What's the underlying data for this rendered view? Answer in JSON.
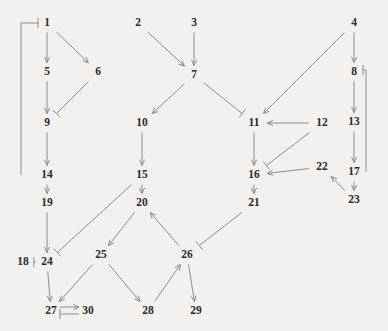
{
  "diagram": {
    "title": "",
    "type": "directed-graph",
    "canvas": {
      "width": 388,
      "height": 331
    },
    "style": {
      "background": "#f2f1ef",
      "edge_color": "#8b8b8b",
      "label_color": "#2b2b2b"
    },
    "nodes": [
      {
        "id": "1",
        "label": "1",
        "x": 47,
        "y": 23
      },
      {
        "id": "2",
        "label": "2",
        "x": 138,
        "y": 23
      },
      {
        "id": "3",
        "label": "3",
        "x": 194,
        "y": 23
      },
      {
        "id": "4",
        "label": "4",
        "x": 354,
        "y": 23
      },
      {
        "id": "5",
        "label": "5",
        "x": 47,
        "y": 72
      },
      {
        "id": "6",
        "label": "6",
        "x": 98,
        "y": 72
      },
      {
        "id": "7",
        "label": "7",
        "x": 194,
        "y": 75
      },
      {
        "id": "8",
        "label": "8",
        "x": 354,
        "y": 72
      },
      {
        "id": "9",
        "label": "9",
        "x": 47,
        "y": 123
      },
      {
        "id": "10",
        "label": "10",
        "x": 142,
        "y": 123
      },
      {
        "id": "11",
        "label": "11",
        "x": 254,
        "y": 123
      },
      {
        "id": "12",
        "label": "12",
        "x": 322,
        "y": 123
      },
      {
        "id": "13",
        "label": "13",
        "x": 354,
        "y": 122
      },
      {
        "id": "14",
        "label": "14",
        "x": 47,
        "y": 175
      },
      {
        "id": "15",
        "label": "15",
        "x": 142,
        "y": 175
      },
      {
        "id": "16",
        "label": "16",
        "x": 254,
        "y": 175
      },
      {
        "id": "17",
        "label": "17",
        "x": 354,
        "y": 172
      },
      {
        "id": "18",
        "label": "18",
        "x": 23,
        "y": 262
      },
      {
        "id": "19",
        "label": "19",
        "x": 47,
        "y": 203
      },
      {
        "id": "20",
        "label": "20",
        "x": 142,
        "y": 203
      },
      {
        "id": "21",
        "label": "21",
        "x": 254,
        "y": 203
      },
      {
        "id": "22",
        "label": "22",
        "x": 322,
        "y": 167
      },
      {
        "id": "23",
        "label": "23",
        "x": 354,
        "y": 200
      },
      {
        "id": "24",
        "label": "24",
        "x": 47,
        "y": 262
      },
      {
        "id": "25",
        "label": "25",
        "x": 101,
        "y": 255
      },
      {
        "id": "26",
        "label": "26",
        "x": 187,
        "y": 255
      },
      {
        "id": "27",
        "label": "27",
        "x": 51,
        "y": 311
      },
      {
        "id": "28",
        "label": "28",
        "x": 148,
        "y": 311
      },
      {
        "id": "29",
        "label": "29",
        "x": 196,
        "y": 311
      },
      {
        "id": "30",
        "label": "30",
        "x": 88,
        "y": 311
      }
    ],
    "edges": [
      {
        "from": "1",
        "to": "5",
        "head": "arrow"
      },
      {
        "from": "1",
        "to": "6",
        "head": "arrow"
      },
      {
        "from": "5",
        "to": "9",
        "head": "arrow"
      },
      {
        "from": "6",
        "to": "9",
        "head": "bar"
      },
      {
        "from": "9",
        "to": "14",
        "head": "arrow"
      },
      {
        "from": "14",
        "to": "1",
        "head": "bar"
      },
      {
        "from": "14",
        "to": "19",
        "head": "arrow"
      },
      {
        "from": "19",
        "to": "24",
        "head": "arrow"
      },
      {
        "from": "2",
        "to": "7",
        "head": "arrow"
      },
      {
        "from": "3",
        "to": "7",
        "head": "arrow"
      },
      {
        "from": "7",
        "to": "10",
        "head": "arrow"
      },
      {
        "from": "7",
        "to": "11",
        "head": "bar"
      },
      {
        "from": "10",
        "to": "15",
        "head": "arrow"
      },
      {
        "from": "15",
        "to": "20",
        "head": "arrow"
      },
      {
        "from": "15",
        "to": "24",
        "head": "bar"
      },
      {
        "from": "4",
        "to": "8",
        "head": "arrow"
      },
      {
        "from": "4",
        "to": "11",
        "head": "arrow"
      },
      {
        "from": "8",
        "to": "13",
        "head": "arrow"
      },
      {
        "from": "13",
        "to": "17",
        "head": "arrow"
      },
      {
        "from": "17",
        "to": "8",
        "head": "bar"
      },
      {
        "from": "17",
        "to": "23",
        "head": "arrow"
      },
      {
        "from": "23",
        "to": "22",
        "head": "arrow"
      },
      {
        "from": "22",
        "to": "16",
        "head": "arrow"
      },
      {
        "from": "12",
        "to": "11",
        "head": "arrow"
      },
      {
        "from": "12",
        "to": "16",
        "head": "bar"
      },
      {
        "from": "11",
        "to": "16",
        "head": "arrow"
      },
      {
        "from": "16",
        "to": "21",
        "head": "arrow"
      },
      {
        "from": "21",
        "to": "26",
        "head": "bar"
      },
      {
        "from": "20",
        "to": "25",
        "head": "arrow"
      },
      {
        "from": "26",
        "to": "20",
        "head": "arrow"
      },
      {
        "from": "18",
        "to": "24",
        "head": "bar"
      },
      {
        "from": "24",
        "to": "27",
        "head": "arrow"
      },
      {
        "from": "25",
        "to": "27",
        "head": "arrow"
      },
      {
        "from": "25",
        "to": "28",
        "head": "arrow"
      },
      {
        "from": "28",
        "to": "26",
        "head": "arrow"
      },
      {
        "from": "26",
        "to": "29",
        "head": "arrow"
      },
      {
        "from": "27",
        "to": "30",
        "head": "arrow"
      },
      {
        "from": "30",
        "to": "27",
        "head": "bar"
      }
    ]
  }
}
